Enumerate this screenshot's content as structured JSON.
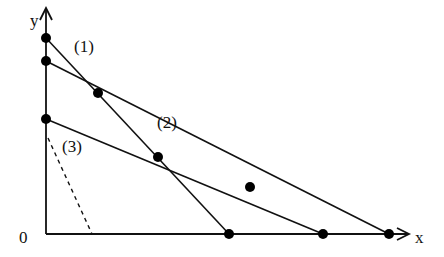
{
  "diagram": {
    "axes": {
      "x_label": "x",
      "y_label": "y",
      "origin_label": "0",
      "origin": [
        46,
        234
      ],
      "x_end": [
        410,
        234
      ],
      "y_end": [
        46,
        8
      ]
    },
    "lines": [
      {
        "id": "1",
        "label": "(1)",
        "label_pos": [
          74,
          52
        ],
        "points": [
          [
            46,
            38
          ],
          [
            229,
            234
          ]
        ]
      },
      {
        "id": "2",
        "label": "(2)",
        "label_pos": [
          157,
          128
        ],
        "points": [
          [
            46,
            61
          ],
          [
            389,
            234
          ]
        ]
      },
      {
        "id": "3",
        "label": "(3)",
        "label_pos": [
          62,
          152
        ],
        "points": [
          [
            46,
            119
          ],
          [
            323,
            234
          ]
        ]
      }
    ],
    "dashed_line": {
      "points": [
        [
          48,
          138
        ],
        [
          92,
          234
        ]
      ]
    },
    "dots": [
      [
        46,
        38
      ],
      [
        46,
        61
      ],
      [
        46,
        119
      ],
      [
        98,
        93
      ],
      [
        158,
        157
      ],
      [
        250,
        187
      ],
      [
        229,
        234
      ],
      [
        323,
        234
      ],
      [
        389,
        234
      ]
    ],
    "labels": {
      "line1": "(1)",
      "line2": "(2)",
      "line3": "(3)",
      "x": "x",
      "y": "y",
      "origin": "0"
    }
  }
}
